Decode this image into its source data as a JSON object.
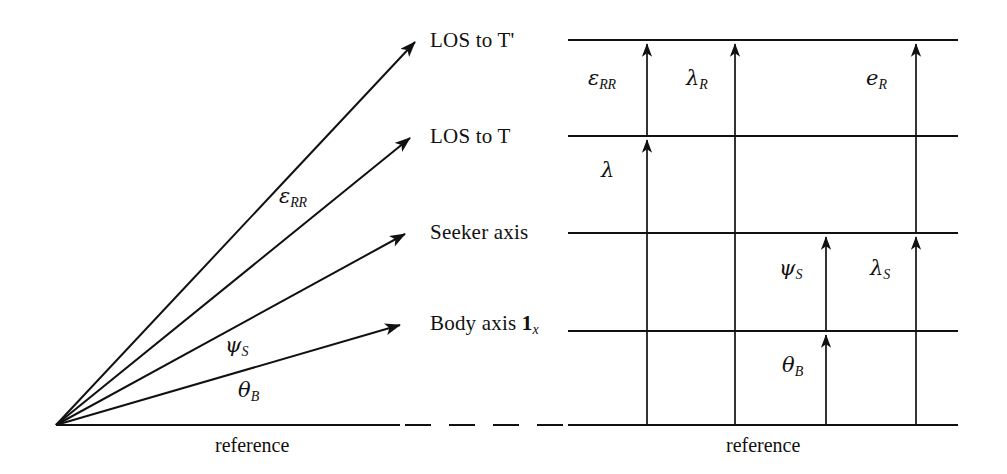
{
  "figure": {
    "type": "geometry-diagram",
    "line_color": "#111111",
    "background_color": "#ffffff"
  },
  "left_panel": {
    "vertex": {
      "x": 56,
      "y": 425
    },
    "reference_label": "reference",
    "rays": [
      {
        "name": "los-to-t-prime",
        "label": "LOS to T'",
        "tip": {
          "x": 415,
          "y": 42
        },
        "label_pos": {
          "x": 430,
          "y": 30
        }
      },
      {
        "name": "los-to-t",
        "label": "LOS to T",
        "tip": {
          "x": 410,
          "y": 138
        },
        "label_pos": {
          "x": 430,
          "y": 126
        }
      },
      {
        "name": "seeker-axis",
        "label": "Seeker axis",
        "tip": {
          "x": 405,
          "y": 234
        },
        "label_pos": {
          "x": 430,
          "y": 222
        }
      },
      {
        "name": "body-axis",
        "label": "Body axis 1x",
        "label_main": "Body axis ",
        "label_bold": "1",
        "label_sub": "x",
        "tip": {
          "x": 400,
          "y": 325
        },
        "label_pos": {
          "x": 430,
          "y": 313
        }
      }
    ],
    "angle_labels": [
      {
        "name": "epsilon-rr",
        "greek": "ε",
        "sub": "RR",
        "x": 279,
        "y": 196
      },
      {
        "name": "psi-s",
        "greek": "ψ",
        "sub": "S",
        "x": 225,
        "y": 345
      },
      {
        "name": "theta-b",
        "greek": "θ",
        "sub": "B",
        "x": 238,
        "y": 390
      }
    ]
  },
  "right_panel": {
    "reference_label": "reference",
    "x_left": 568,
    "x_right": 958,
    "horizontal_lines": [
      {
        "name": "line-los-to-t-prime",
        "y": 40,
        "corresponds_to": "LOS to T'"
      },
      {
        "name": "line-los-to-t",
        "y": 136,
        "corresponds_to": "LOS to T"
      },
      {
        "name": "line-seeker-axis",
        "y": 233,
        "corresponds_to": "Seeker axis"
      },
      {
        "name": "line-body-axis",
        "y": 331,
        "corresponds_to": "Body axis 1x"
      },
      {
        "name": "line-reference",
        "y": 425,
        "corresponds_to": "reference"
      }
    ],
    "columns": [
      {
        "name": "column-1",
        "x": 647
      },
      {
        "name": "column-2",
        "x": 735
      },
      {
        "name": "column-3",
        "x": 826
      },
      {
        "name": "column-4",
        "x": 916
      }
    ],
    "measures": [
      {
        "name": "epsilon-rr-measure",
        "greek": "ε",
        "sub": "RR",
        "x": 647,
        "from_y": 136,
        "to_y": 40,
        "label_x": 590,
        "label_y": 78
      },
      {
        "name": "lambda-measure",
        "greek": "λ",
        "sub": "",
        "x": 647,
        "from_y": 233,
        "to_y": 136,
        "label_x": 598,
        "label_y": 170
      },
      {
        "name": "lambda-r-measure",
        "greek": "λ",
        "sub": "R",
        "x": 735,
        "from_y": 425,
        "to_y": 40,
        "label_x": 684,
        "label_y": 78
      },
      {
        "name": "e-r-measure",
        "greek": "e",
        "sub": "R",
        "x": 916,
        "from_y": 233,
        "to_y": 40,
        "label_x": 862,
        "label_y": 78
      },
      {
        "name": "psi-s-measure",
        "greek": "ψ",
        "sub": "S",
        "x": 826,
        "from_y": 331,
        "to_y": 233,
        "label_x": 778,
        "label_y": 268
      },
      {
        "name": "lambda-s-measure",
        "greek": "λ",
        "sub": "S",
        "x": 916,
        "from_y": 425,
        "to_y": 233,
        "label_x": 868,
        "label_y": 268
      },
      {
        "name": "theta-b-measure",
        "greek": "θ",
        "sub": "B",
        "x": 826,
        "from_y": 425,
        "to_y": 331,
        "label_x": 780,
        "label_y": 365
      }
    ]
  },
  "connector": {
    "name": "dashed-reference-connector",
    "y": 425,
    "from_x": 400,
    "to_x": 568,
    "style": "dashed"
  }
}
